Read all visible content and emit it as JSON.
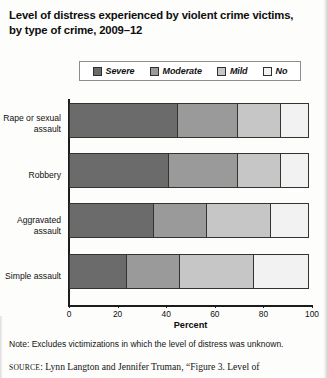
{
  "title": "Level of distress experienced by violent crime victims, by type of crime, 2009–12",
  "legend": {
    "items": [
      {
        "label": "Severe",
        "color": "#6b6b6b"
      },
      {
        "label": "Moderate",
        "color": "#9a9a9a"
      },
      {
        "label": "Mild",
        "color": "#c6c6c6"
      },
      {
        "label": "No",
        "color": "#f2f2f2"
      }
    ]
  },
  "axis": {
    "xlabel": "Percent",
    "ticks": [
      "0",
      "20",
      "40",
      "60",
      "80",
      "100"
    ],
    "tick_values": [
      0,
      20,
      40,
      60,
      80,
      100
    ]
  },
  "footer": {
    "note": "Note: Excludes victimizations in which the level of distress was unknown.",
    "source_prefix": "SOURCE",
    "source_text": ": Lynn Langton and Jennifer Truman, “Figure 3. Level of"
  },
  "chart_data": {
    "type": "bar",
    "orientation": "horizontal",
    "stacked": true,
    "percent_stacked": true,
    "title": "Level of distress experienced by violent crime victims, by type of crime, 2009–12",
    "xlabel": "Percent",
    "ylabel": "",
    "xlim": [
      0,
      100
    ],
    "grid": false,
    "legend_position": "top",
    "categories": [
      "Rape or sexual assault",
      "Robbery",
      "Aggravated assault",
      "Simple assault"
    ],
    "series": [
      {
        "name": "Severe",
        "color": "#6b6b6b",
        "values": [
          45,
          41,
          35,
          24
        ]
      },
      {
        "name": "Moderate",
        "color": "#9a9a9a",
        "values": [
          25,
          29,
          22,
          22
        ]
      },
      {
        "name": "Mild",
        "color": "#c6c6c6",
        "values": [
          18,
          18,
          27,
          31
        ]
      },
      {
        "name": "No",
        "color": "#f2f2f2",
        "values": [
          12,
          12,
          16,
          23
        ]
      }
    ],
    "note": "Note: Excludes victimizations in which the level of distress was unknown."
  }
}
